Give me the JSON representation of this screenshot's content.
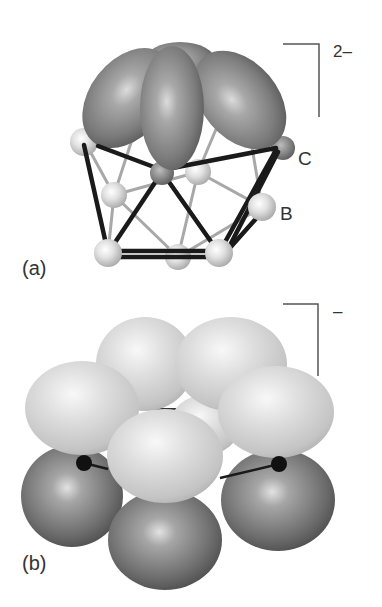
{
  "figure": {
    "panels": [
      {
        "id": "a",
        "label": "(a)",
        "charge": "2–",
        "atom_labels": {
          "carbon": "C",
          "boron": "B"
        }
      },
      {
        "id": "b",
        "label": "(b)",
        "charge": "–"
      }
    ]
  },
  "colors": {
    "dark_lobe": "#8a8a8a",
    "light_lobe": "#d4d4d4",
    "atom": "#dcdcdc",
    "bond_front": "#1a1a1a",
    "bond_back": "#a8a8a8",
    "bracket": "#555555",
    "text": "#333333"
  }
}
